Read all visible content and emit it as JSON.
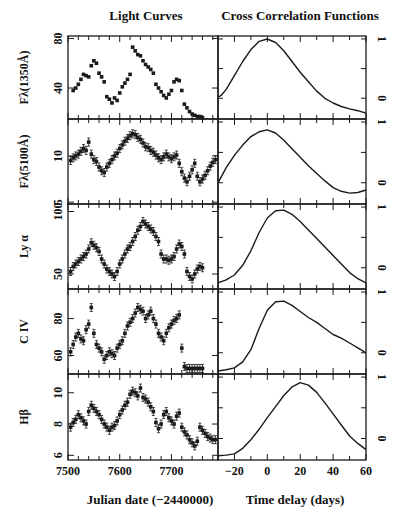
{
  "titles": {
    "left": "Light Curves",
    "right": "Cross Correlation Functions"
  },
  "xlabels": {
    "left": "Julian date (−2440000)",
    "right": "Time delay (days)"
  },
  "colors": {
    "ink": "#1a1a1a",
    "background": "#ffffff"
  },
  "chart_data": [
    {
      "type": "scatter",
      "title": "Light Curves",
      "xlabel": "Julian date (-2440000)",
      "xlim": [
        7500,
        7790
      ],
      "xticks": [
        7500,
        7600,
        7700
      ],
      "panels": [
        {
          "ylabel": "Fλ(1350Å)",
          "ylim": [
            15,
            82
          ],
          "yticks": [
            40,
            80
          ],
          "yticklabels": [
            "40",
            "80"
          ],
          "x": [
            7510,
            7515,
            7520,
            7525,
            7530,
            7535,
            7540,
            7545,
            7550,
            7555,
            7560,
            7565,
            7570,
            7575,
            7580,
            7585,
            7590,
            7595,
            7600,
            7605,
            7610,
            7615,
            7620,
            7625,
            7630,
            7635,
            7640,
            7645,
            7650,
            7655,
            7660,
            7665,
            7670,
            7675,
            7680,
            7685,
            7690,
            7695,
            7700,
            7705,
            7710,
            7715,
            7720,
            7725,
            7730,
            7735,
            7740,
            7745,
            7750,
            7755,
            7760
          ],
          "y": [
            38,
            40,
            43,
            47,
            51,
            50,
            49,
            58,
            62,
            60,
            52,
            49,
            45,
            33,
            31,
            28,
            32,
            30,
            36,
            41,
            44,
            47,
            51,
            73,
            70,
            67,
            66,
            62,
            59,
            57,
            55,
            52,
            43,
            40,
            37,
            34,
            32,
            35,
            38,
            45,
            47,
            46,
            38,
            27,
            24,
            21,
            19,
            18,
            17,
            17,
            16
          ]
        },
        {
          "ylabel": "Fλ(5100Å)",
          "ylim": [
            4.8,
            14
          ],
          "yticks": [
            5,
            10
          ],
          "yticklabels": [
            "5",
            "10"
          ],
          "x": [
            7505,
            7510,
            7515,
            7520,
            7525,
            7530,
            7535,
            7540,
            7545,
            7550,
            7555,
            7560,
            7565,
            7570,
            7575,
            7580,
            7585,
            7590,
            7595,
            7600,
            7605,
            7610,
            7615,
            7620,
            7625,
            7630,
            7635,
            7640,
            7645,
            7650,
            7655,
            7660,
            7665,
            7670,
            7675,
            7680,
            7685,
            7690,
            7695,
            7700,
            7705,
            7710,
            7715,
            7720,
            7725,
            7730,
            7735,
            7740,
            7745,
            7750,
            7755,
            7760,
            7765,
            7770,
            7775,
            7780,
            7785
          ],
          "y": [
            9.5,
            9.8,
            10,
            10.2,
            10.5,
            10.8,
            10.6,
            11.5,
            10.2,
            9.6,
            9.4,
            8.8,
            8.4,
            8.2,
            8.8,
            9.2,
            9.6,
            10,
            10.3,
            10.8,
            11.2,
            11.6,
            11.9,
            12.2,
            12.4,
            12.3,
            12,
            11.8,
            11.4,
            11,
            10.9,
            10.6,
            10.4,
            10.1,
            9.8,
            9.6,
            9.9,
            10.2,
            9.9,
            9.7,
            9.9,
            10.1,
            9.2,
            8.3,
            7.6,
            7.2,
            7.8,
            8.5,
            9.2,
            7.8,
            7.2,
            7.5,
            7.9,
            8.4,
            8.9,
            9.3,
            9.6
          ]
        },
        {
          "ylabel": "Ly α",
          "ylim": [
            38,
            106
          ],
          "yticks": [
            50,
            100
          ],
          "yticklabels": [
            "50",
            "100"
          ],
          "x": [
            7505,
            7510,
            7515,
            7520,
            7525,
            7530,
            7535,
            7540,
            7545,
            7550,
            7555,
            7560,
            7565,
            7570,
            7575,
            7580,
            7585,
            7590,
            7595,
            7600,
            7605,
            7610,
            7615,
            7620,
            7625,
            7630,
            7635,
            7640,
            7645,
            7650,
            7655,
            7660,
            7665,
            7670,
            7675,
            7680,
            7685,
            7690,
            7695,
            7700,
            7705,
            7710,
            7715,
            7720,
            7725,
            7730,
            7735,
            7740,
            7745,
            7750,
            7755,
            7760
          ],
          "y": [
            52,
            56,
            58,
            60,
            62,
            64,
            66,
            70,
            75,
            73,
            71,
            68,
            62,
            58,
            54,
            52,
            50,
            48,
            52,
            58,
            62,
            66,
            70,
            72,
            76,
            80,
            85,
            88,
            92,
            90,
            88,
            86,
            84,
            80,
            76,
            66,
            62,
            62,
            61,
            62,
            64,
            70,
            74,
            72,
            66,
            52,
            48,
            46,
            50,
            54,
            56,
            55
          ]
        },
        {
          "ylabel": "C IV",
          "ylim": [
            50,
            96
          ],
          "yticks": [
            60,
            80
          ],
          "yticklabels": [
            "60",
            "80"
          ],
          "x": [
            7505,
            7510,
            7515,
            7520,
            7525,
            7530,
            7535,
            7540,
            7545,
            7550,
            7555,
            7560,
            7565,
            7570,
            7575,
            7580,
            7585,
            7590,
            7595,
            7600,
            7605,
            7610,
            7615,
            7620,
            7625,
            7630,
            7635,
            7640,
            7645,
            7650,
            7655,
            7660,
            7665,
            7670,
            7675,
            7680,
            7685,
            7690,
            7695,
            7700,
            7705,
            7710,
            7715,
            7720,
            7725,
            7730,
            7735,
            7740,
            7745,
            7750,
            7755,
            7760
          ],
          "y": [
            62,
            66,
            70,
            72,
            69,
            68,
            74,
            77,
            86,
            72,
            66,
            64,
            62,
            58,
            60,
            62,
            61,
            60,
            64,
            66,
            68,
            72,
            76,
            78,
            80,
            83,
            86,
            85,
            84,
            80,
            82,
            84,
            80,
            77,
            72,
            70,
            68,
            72,
            75,
            77,
            79,
            80,
            82,
            64,
            54,
            53,
            53,
            53,
            53,
            53,
            53,
            53
          ]
        },
        {
          "ylabel": "Hβ",
          "ylim": [
            5.7,
            11.2
          ],
          "yticks": [
            6,
            8,
            10
          ],
          "yticklabels": [
            "6",
            "8",
            "10"
          ],
          "x": [
            7505,
            7510,
            7515,
            7520,
            7525,
            7530,
            7535,
            7540,
            7545,
            7550,
            7555,
            7560,
            7565,
            7570,
            7575,
            7580,
            7585,
            7590,
            7595,
            7600,
            7605,
            7610,
            7615,
            7620,
            7625,
            7630,
            7635,
            7640,
            7645,
            7650,
            7655,
            7660,
            7665,
            7670,
            7675,
            7680,
            7685,
            7690,
            7695,
            7700,
            7705,
            7710,
            7715,
            7720,
            7725,
            7730,
            7735,
            7740,
            7745,
            7750,
            7755,
            7760,
            7765,
            7770,
            7775,
            7780,
            7785
          ],
          "y": [
            7.8,
            8.1,
            8.3,
            8.6,
            8.4,
            8.2,
            8.0,
            8.8,
            9.2,
            9.0,
            8.8,
            8.6,
            8.3,
            8.0,
            7.8,
            7.6,
            7.8,
            7.9,
            8.2,
            8.6,
            8.9,
            9.2,
            9.4,
            9.9,
            10.1,
            10.0,
            9.8,
            10.3,
            9.7,
            9.6,
            9.4,
            9.1,
            8.8,
            8.1,
            7.7,
            8.0,
            8.6,
            8.8,
            8.4,
            8.2,
            8.0,
            8.5,
            8.7,
            7.8,
            7.5,
            7.3,
            7.0,
            6.8,
            6.6,
            6.9,
            7.8,
            7.6,
            7.4,
            7.2,
            7.1,
            7.0,
            7.0
          ]
        }
      ]
    },
    {
      "type": "line",
      "title": "Cross Correlation Functions",
      "xlabel": "Time delay (days)",
      "xlim": [
        -30,
        60
      ],
      "xticks": [
        -20,
        0,
        20,
        40,
        60
      ],
      "xticklabels": [
        "−20",
        "0",
        "20",
        "40",
        "60"
      ],
      "ylim_per_panel": [
        -0.35,
        1.05
      ],
      "yticks_right": [
        0,
        1
      ],
      "panels": [
        {
          "name": "F1350",
          "x": [
            -30,
            -28,
            -25,
            -20,
            -15,
            -10,
            -5,
            0,
            5,
            10,
            15,
            20,
            25,
            30,
            35,
            40,
            45,
            50,
            55,
            60
          ],
          "y": [
            0.02,
            0.05,
            0.15,
            0.38,
            0.62,
            0.82,
            0.96,
            1.0,
            0.94,
            0.8,
            0.62,
            0.44,
            0.28,
            0.12,
            0.0,
            -0.08,
            -0.14,
            -0.18,
            -0.21,
            -0.25
          ]
        },
        {
          "name": "F5100",
          "x": [
            -30,
            -25,
            -20,
            -15,
            -10,
            -5,
            0,
            5,
            10,
            15,
            20,
            25,
            30,
            35,
            40,
            45,
            50,
            55,
            60
          ],
          "y": [
            0.0,
            0.25,
            0.45,
            0.62,
            0.76,
            0.84,
            0.87,
            0.82,
            0.7,
            0.56,
            0.42,
            0.28,
            0.15,
            0.03,
            -0.08,
            -0.14,
            -0.17,
            -0.16,
            -0.12
          ]
        },
        {
          "name": "LyA",
          "x": [
            -30,
            -25,
            -20,
            -15,
            -10,
            -5,
            0,
            5,
            10,
            15,
            20,
            25,
            30,
            35,
            40,
            45,
            50,
            55,
            60
          ],
          "y": [
            -0.25,
            -0.2,
            -0.12,
            0.04,
            0.28,
            0.58,
            0.82,
            0.94,
            0.95,
            0.88,
            0.76,
            0.62,
            0.48,
            0.34,
            0.2,
            0.06,
            -0.08,
            -0.18,
            -0.25
          ]
        },
        {
          "name": "CIV",
          "x": [
            -30,
            -25,
            -20,
            -15,
            -10,
            -5,
            0,
            5,
            10,
            15,
            20,
            25,
            30,
            35,
            40,
            45,
            50,
            55,
            60
          ],
          "y": [
            -0.3,
            -0.28,
            -0.25,
            -0.15,
            0.05,
            0.4,
            0.7,
            0.84,
            0.85,
            0.78,
            0.68,
            0.58,
            0.5,
            0.4,
            0.3,
            0.24,
            0.16,
            0.08,
            0.0
          ]
        },
        {
          "name": "Hbeta",
          "x": [
            -30,
            -25,
            -20,
            -15,
            -10,
            -5,
            0,
            5,
            10,
            15,
            20,
            25,
            30,
            35,
            40,
            45,
            50,
            55,
            60
          ],
          "y": [
            -0.28,
            -0.27,
            -0.25,
            -0.16,
            -0.02,
            0.15,
            0.34,
            0.52,
            0.7,
            0.84,
            0.91,
            0.87,
            0.75,
            0.58,
            0.4,
            0.22,
            0.04,
            -0.08,
            -0.18
          ]
        }
      ]
    }
  ]
}
